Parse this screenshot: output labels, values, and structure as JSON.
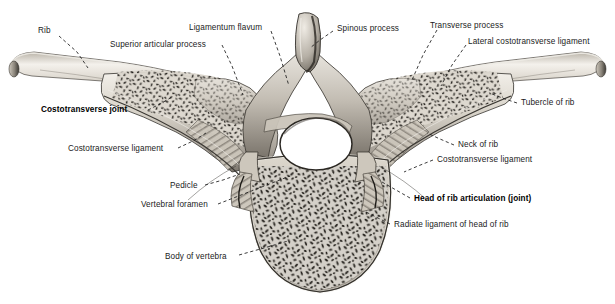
{
  "figure": {
    "view": "superior (axial) section",
    "style": "grayscale anatomical halftone illustration",
    "background_color": "#ffffff",
    "ink_color": "#1b1b1b",
    "bone_light": "#e9e6df",
    "bone_mid": "#b2ada3",
    "bone_dark": "#6d685f",
    "trabecular_color": "#2b2822"
  },
  "labels": [
    {
      "id": "rib",
      "text": "Rib",
      "bold": false,
      "align": "left",
      "x": 38,
      "y": 27,
      "leader": [
        [
          59,
          36
        ],
        [
          77,
          52
        ],
        [
          88,
          68
        ]
      ]
    },
    {
      "id": "superior-articular-process",
      "text": "Superior articular process",
      "bold": false,
      "align": "left",
      "x": 110,
      "y": 41,
      "leader": [
        [
          222,
          45
        ],
        [
          232,
          66
        ],
        [
          243,
          95
        ]
      ]
    },
    {
      "id": "ligamentum-flavum",
      "text": "Ligamentum flavum",
      "bold": false,
      "align": "left",
      "x": 189,
      "y": 24,
      "leader": [
        [
          271,
          31
        ],
        [
          280,
          56
        ],
        [
          289,
          86
        ]
      ]
    },
    {
      "id": "spinous-process",
      "text": "Spinous process",
      "bold": false,
      "align": "left",
      "x": 337,
      "y": 25,
      "leader": [
        [
          333,
          31
        ],
        [
          320,
          40
        ],
        [
          310,
          48
        ]
      ]
    },
    {
      "id": "transverse-process",
      "text": "Transverse process",
      "bold": false,
      "align": "left",
      "x": 430,
      "y": 22,
      "leader": [
        [
          437,
          30
        ],
        [
          423,
          55
        ],
        [
          412,
          80
        ]
      ]
    },
    {
      "id": "lateral-costotransverse-ligament",
      "text": "Lateral costotransverse ligament",
      "bold": false,
      "align": "left",
      "x": 468,
      "y": 38,
      "leader": [
        [
          466,
          45
        ],
        [
          452,
          65
        ],
        [
          441,
          86
        ]
      ]
    },
    {
      "id": "costotransverse-joint",
      "text": "Costotransverse joint",
      "bold": true,
      "align": "left",
      "x": 41,
      "y": 106,
      "leader": [
        [
          148,
          110
        ],
        [
          160,
          104
        ],
        [
          172,
          97
        ]
      ]
    },
    {
      "id": "tubercle-of-rib",
      "text": "Tubercle of rib",
      "bold": false,
      "align": "left",
      "x": 521,
      "y": 99,
      "leader": [
        [
          517,
          103
        ],
        [
          505,
          99
        ],
        [
          492,
          94
        ]
      ]
    },
    {
      "id": "costotransverse-ligament-left",
      "text": "Costotransverse ligament",
      "bold": false,
      "align": "left",
      "x": 68,
      "y": 145,
      "leader": [
        [
          178,
          148
        ],
        [
          193,
          141
        ],
        [
          206,
          133
        ]
      ]
    },
    {
      "id": "neck-of-rib",
      "text": "Neck of rib",
      "bold": false,
      "align": "left",
      "x": 458,
      "y": 141,
      "leader": [
        [
          454,
          145
        ],
        [
          440,
          139
        ],
        [
          427,
          133
        ]
      ]
    },
    {
      "id": "costotransverse-ligament-right",
      "text": "Costotransverse ligament",
      "bold": false,
      "align": "left",
      "x": 437,
      "y": 156,
      "leader": [
        [
          433,
          160
        ],
        [
          418,
          166
        ],
        [
          404,
          172
        ]
      ]
    },
    {
      "id": "pedicle",
      "text": "Pedicle",
      "bold": false,
      "align": "left",
      "x": 170,
      "y": 182,
      "leader": [
        [
          205,
          185
        ],
        [
          223,
          180
        ],
        [
          240,
          174
        ]
      ]
    },
    {
      "id": "vertebral-foramen",
      "text": "Vertebral foramen",
      "bold": false,
      "align": "left",
      "x": 141,
      "y": 201,
      "leader": [
        [
          218,
          204
        ],
        [
          254,
          190
        ],
        [
          290,
          176
        ]
      ]
    },
    {
      "id": "head-of-rib-articulation",
      "text": "Head of rib articulation (joint)",
      "bold": true,
      "align": "left",
      "x": 414,
      "y": 195,
      "leader": [
        [
          410,
          198
        ],
        [
          396,
          190
        ],
        [
          382,
          182
        ]
      ]
    },
    {
      "id": "radiate-ligament-of-head-of-rib",
      "text": "Radiate ligament of head of rib",
      "bold": false,
      "align": "left",
      "x": 394,
      "y": 221,
      "leader": [
        [
          390,
          224
        ],
        [
          378,
          218
        ],
        [
          366,
          212
        ]
      ]
    },
    {
      "id": "body-of-vertebra",
      "text": "Body of vertebra",
      "bold": false,
      "align": "left",
      "x": 165,
      "y": 253,
      "leader": [
        [
          239,
          255
        ],
        [
          264,
          248
        ],
        [
          288,
          241
        ]
      ]
    }
  ]
}
